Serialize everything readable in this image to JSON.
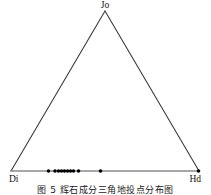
{
  "figure": {
    "caption": "图 5  辉石成分三角地投点分布图",
    "background_color": "#ffffff",
    "line_color": "#3c3c3c",
    "base_line_color": "#808080",
    "point_color": "#000000"
  },
  "chart_data": {
    "type": "scatter",
    "plot_style": "ternary",
    "title": "",
    "subtitle": "",
    "xlabel": "",
    "ylabel": "",
    "grid": false,
    "legend": null,
    "vertices": [
      {
        "name": "apex",
        "label": "Jo",
        "x": 105,
        "y": 11
      },
      {
        "name": "bottom-left",
        "label": "Di",
        "x": 11,
        "y": 171
      },
      {
        "name": "bottom-right",
        "label": "Hd",
        "x": 199,
        "y": 171
      }
    ],
    "axis_note": "All plotted points lie on the Di–Hd base edge (Jo component ≈ 0)",
    "series": [
      {
        "name": "pyroxene compositions",
        "marker": "filled-circle",
        "marker_size_px": 3.6,
        "color": "#000000",
        "points": [
          {
            "label": "p1",
            "di": 0.79,
            "hd": 0.21,
            "jo": 0.0,
            "px": 48.5,
            "py": 171
          },
          {
            "label": "p2",
            "di": 0.7,
            "hd": 0.3,
            "jo": 0.0,
            "px": 55.0,
            "py": 171
          },
          {
            "label": "p3",
            "di": 0.68,
            "hd": 0.32,
            "jo": 0.0,
            "px": 58.5,
            "py": 171
          },
          {
            "label": "p4",
            "di": 0.66,
            "hd": 0.34,
            "jo": 0.0,
            "px": 61.5,
            "py": 171
          },
          {
            "label": "p5",
            "di": 0.64,
            "hd": 0.36,
            "jo": 0.0,
            "px": 64.5,
            "py": 171
          },
          {
            "label": "p6",
            "di": 0.62,
            "hd": 0.38,
            "jo": 0.0,
            "px": 67.5,
            "py": 171
          },
          {
            "label": "p7",
            "di": 0.6,
            "hd": 0.4,
            "jo": 0.0,
            "px": 70.5,
            "py": 171
          },
          {
            "label": "p8",
            "di": 0.58,
            "hd": 0.42,
            "jo": 0.0,
            "px": 73.5,
            "py": 171
          },
          {
            "label": "p9",
            "di": 0.55,
            "hd": 0.45,
            "jo": 0.0,
            "px": 78.5,
            "py": 171
          },
          {
            "label": "p10",
            "di": 0.47,
            "hd": 0.53,
            "jo": 0.0,
            "px": 100.5,
            "py": 171
          },
          {
            "label": "p11",
            "di": 0.0,
            "hd": 1.0,
            "jo": 0.0,
            "px": 198.5,
            "py": 171
          }
        ]
      }
    ]
  }
}
